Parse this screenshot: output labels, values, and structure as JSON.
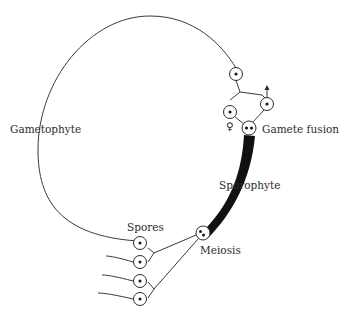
{
  "labels": {
    "gametophyte": "Gametophyte",
    "gamete_fusion": "Gamete fusion",
    "sporophyte": "Sporophyte",
    "meiosis": "Meiosis",
    "spores": "Spores",
    "female_symbol": "♀",
    "male_symbol": "↑"
  },
  "colors": {
    "ink": "#2b2b2b",
    "sporophyte_band": "#111111",
    "background": "#ffffff"
  }
}
